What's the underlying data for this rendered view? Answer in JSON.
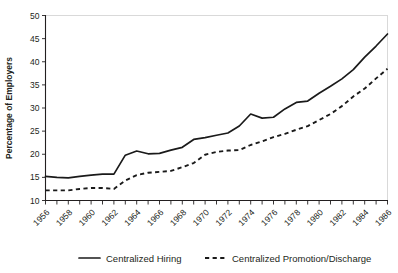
{
  "chart_data": {
    "type": "line",
    "title": "",
    "xlabel": "",
    "ylabel": "Percentage of Employers",
    "xlim": [
      1956,
      1986
    ],
    "ylim": [
      10,
      50
    ],
    "yticks": [
      10,
      15,
      20,
      25,
      30,
      35,
      40,
      45,
      50
    ],
    "ytick_labels": [
      "10",
      "15",
      "20",
      "25",
      "30",
      "35",
      "40",
      "45",
      "50"
    ],
    "xticks": [
      1956,
      1958,
      1960,
      1962,
      1964,
      1966,
      1968,
      1970,
      1972,
      1974,
      1976,
      1978,
      1980,
      1982,
      1984,
      1986
    ],
    "xtick_labels": [
      "1956",
      "1958",
      "1960",
      "1962",
      "1964",
      "1966",
      "1968",
      "1970",
      "1972",
      "1974",
      "1976",
      "1978",
      "1980",
      "1982",
      "1984",
      "1986"
    ],
    "x_minor_tick_step": 1,
    "grid": false,
    "legend_position": "below",
    "x": [
      1956,
      1957,
      1958,
      1959,
      1960,
      1961,
      1962,
      1963,
      1964,
      1965,
      1966,
      1967,
      1968,
      1969,
      1970,
      1971,
      1972,
      1973,
      1974,
      1975,
      1976,
      1977,
      1978,
      1979,
      1980,
      1981,
      1982,
      1983,
      1984,
      1985,
      1986
    ],
    "series": [
      {
        "name": "Centralized Hiring",
        "style": "solid",
        "color": "#1a1a1a",
        "values": [
          15.2,
          15.0,
          14.9,
          15.2,
          15.5,
          15.7,
          15.7,
          19.8,
          20.7,
          20.1,
          20.2,
          20.9,
          21.5,
          23.2,
          23.6,
          24.1,
          24.6,
          26.1,
          28.7,
          27.8,
          28.0,
          29.8,
          31.2,
          31.5,
          33.2,
          34.7,
          36.3,
          38.3,
          41.0,
          43.4,
          46.0
        ]
      },
      {
        "name": "Centralized Promotion/Discharge",
        "style": "dashed",
        "color": "#1a1a1a",
        "values": [
          12.2,
          12.2,
          12.2,
          12.5,
          12.7,
          12.7,
          12.5,
          14.3,
          15.5,
          16.0,
          16.2,
          16.4,
          17.2,
          18.1,
          19.9,
          20.5,
          20.8,
          20.9,
          22.0,
          22.8,
          23.7,
          24.4,
          25.3,
          26.1,
          27.4,
          28.7,
          30.4,
          32.5,
          34.2,
          36.4,
          38.5
        ]
      }
    ]
  },
  "legend": {
    "items": [
      {
        "label": "Centralized Hiring",
        "style": "solid"
      },
      {
        "label": "Centralized Promotion/Discharge",
        "style": "dashed"
      }
    ]
  }
}
